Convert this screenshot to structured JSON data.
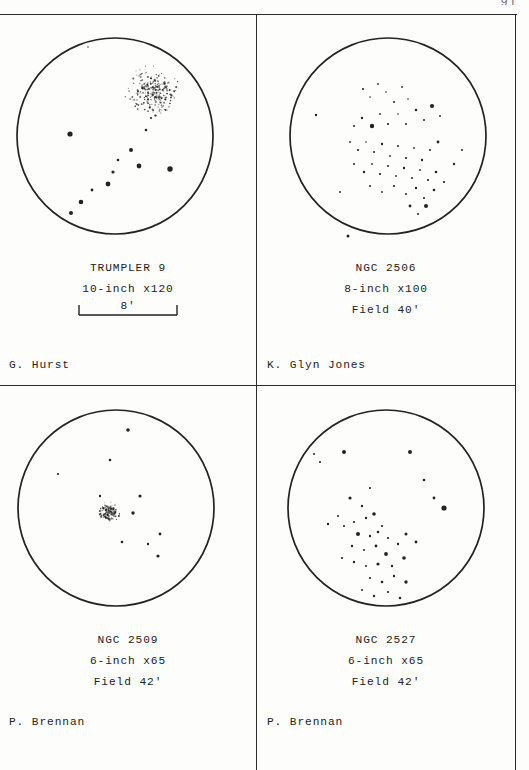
{
  "page": {
    "number": "91",
    "background_color": "#fdfdfb",
    "ink_color": "#232323"
  },
  "panels": [
    {
      "id": "trumpler-9",
      "object_name": "TRUMPLER 9",
      "instrument": "10-inch x120",
      "field_note": "",
      "scale_label": "8'",
      "observer": "G. Hurst",
      "circle": {
        "cx": 115,
        "cy": 122,
        "r": 98
      },
      "dense_cluster": {
        "cx": 152,
        "cy": 77,
        "r": 25,
        "point_count": 260,
        "type": "stipple"
      },
      "stars": [
        {
          "x": 88,
          "y": 33,
          "r": 0.7
        },
        {
          "x": 70,
          "y": 120,
          "r": 2.6
        },
        {
          "x": 146,
          "y": 116,
          "r": 1.3
        },
        {
          "x": 131,
          "y": 136,
          "r": 2.0
        },
        {
          "x": 118,
          "y": 146,
          "r": 1.3
        },
        {
          "x": 113,
          "y": 158,
          "r": 1.6
        },
        {
          "x": 139,
          "y": 152,
          "r": 2.4
        },
        {
          "x": 151,
          "y": 104,
          "r": 1.1
        },
        {
          "x": 170,
          "y": 155,
          "r": 2.7
        },
        {
          "x": 108,
          "y": 170,
          "r": 2.4
        },
        {
          "x": 92,
          "y": 176,
          "r": 1.4
        },
        {
          "x": 81,
          "y": 188,
          "r": 2.3
        },
        {
          "x": 71,
          "y": 199,
          "r": 2.0
        }
      ]
    },
    {
      "id": "ngc-2506",
      "object_name": "NGC 2506",
      "instrument": "8-inch x100",
      "field_note": "Field 40'",
      "scale_label": "",
      "observer": "K. Glyn Jones",
      "circle": {
        "cx": 130,
        "cy": 122,
        "r": 98
      },
      "dense_cluster": null,
      "stars": [
        {
          "x": 58,
          "y": 101,
          "r": 1.2
        },
        {
          "x": 82,
          "y": 178,
          "r": 1.0
        },
        {
          "x": 90,
          "y": 222,
          "r": 1.5
        },
        {
          "x": 105,
          "y": 75,
          "r": 1.1
        },
        {
          "x": 112,
          "y": 83,
          "r": 0.8
        },
        {
          "x": 120,
          "y": 70,
          "r": 0.9
        },
        {
          "x": 128,
          "y": 78,
          "r": 0.8
        },
        {
          "x": 136,
          "y": 88,
          "r": 1.0
        },
        {
          "x": 144,
          "y": 73,
          "r": 0.9
        },
        {
          "x": 150,
          "y": 85,
          "r": 0.8
        },
        {
          "x": 96,
          "y": 112,
          "r": 1.0
        },
        {
          "x": 104,
          "y": 104,
          "r": 1.2
        },
        {
          "x": 114,
          "y": 112,
          "r": 2.2
        },
        {
          "x": 122,
          "y": 100,
          "r": 0.9
        },
        {
          "x": 130,
          "y": 110,
          "r": 1.1
        },
        {
          "x": 140,
          "y": 100,
          "r": 0.8
        },
        {
          "x": 148,
          "y": 110,
          "r": 1.0
        },
        {
          "x": 158,
          "y": 96,
          "r": 1.3
        },
        {
          "x": 166,
          "y": 106,
          "r": 1.0
        },
        {
          "x": 174,
          "y": 92,
          "r": 2.1
        },
        {
          "x": 182,
          "y": 102,
          "r": 0.9
        },
        {
          "x": 92,
          "y": 128,
          "r": 0.9
        },
        {
          "x": 100,
          "y": 136,
          "r": 1.1
        },
        {
          "x": 108,
          "y": 128,
          "r": 0.8
        },
        {
          "x": 116,
          "y": 138,
          "r": 1.0
        },
        {
          "x": 124,
          "y": 130,
          "r": 1.2
        },
        {
          "x": 132,
          "y": 142,
          "r": 0.9
        },
        {
          "x": 140,
          "y": 132,
          "r": 1.0
        },
        {
          "x": 148,
          "y": 144,
          "r": 1.1
        },
        {
          "x": 156,
          "y": 134,
          "r": 0.9
        },
        {
          "x": 164,
          "y": 146,
          "r": 1.2
        },
        {
          "x": 172,
          "y": 136,
          "r": 1.0
        },
        {
          "x": 180,
          "y": 128,
          "r": 1.4
        },
        {
          "x": 96,
          "y": 150,
          "r": 1.0
        },
        {
          "x": 106,
          "y": 158,
          "r": 1.2
        },
        {
          "x": 114,
          "y": 150,
          "r": 0.9
        },
        {
          "x": 122,
          "y": 160,
          "r": 1.1
        },
        {
          "x": 130,
          "y": 152,
          "r": 1.0
        },
        {
          "x": 138,
          "y": 162,
          "r": 0.9
        },
        {
          "x": 146,
          "y": 154,
          "r": 1.2
        },
        {
          "x": 154,
          "y": 164,
          "r": 1.0
        },
        {
          "x": 162,
          "y": 156,
          "r": 0.9
        },
        {
          "x": 170,
          "y": 166,
          "r": 1.1
        },
        {
          "x": 178,
          "y": 158,
          "r": 1.3
        },
        {
          "x": 112,
          "y": 172,
          "r": 1.0
        },
        {
          "x": 124,
          "y": 178,
          "r": 0.9
        },
        {
          "x": 136,
          "y": 172,
          "r": 1.1
        },
        {
          "x": 148,
          "y": 180,
          "r": 1.0
        },
        {
          "x": 158,
          "y": 174,
          "r": 1.2
        },
        {
          "x": 166,
          "y": 184,
          "r": 1.0
        },
        {
          "x": 176,
          "y": 176,
          "r": 1.3
        },
        {
          "x": 186,
          "y": 168,
          "r": 1.1
        },
        {
          "x": 152,
          "y": 192,
          "r": 1.4
        },
        {
          "x": 160,
          "y": 200,
          "r": 1.0
        },
        {
          "x": 168,
          "y": 192,
          "r": 2.0
        },
        {
          "x": 196,
          "y": 150,
          "r": 1.2
        },
        {
          "x": 204,
          "y": 136,
          "r": 1.0
        }
      ]
    },
    {
      "id": "ngc-2509",
      "object_name": "NGC 2509",
      "instrument": "6-inch x65",
      "field_note": "Field 42'",
      "scale_label": "",
      "observer": "P. Brennan",
      "circle": {
        "cx": 116,
        "cy": 122,
        "r": 98
      },
      "dense_cluster": {
        "cx": 108,
        "cy": 126,
        "r": 11,
        "point_count": 150,
        "type": "stipple"
      },
      "stars": [
        {
          "x": 128,
          "y": 44,
          "r": 1.8
        },
        {
          "x": 110,
          "y": 74,
          "r": 1.3
        },
        {
          "x": 58,
          "y": 88,
          "r": 1.1
        },
        {
          "x": 140,
          "y": 110,
          "r": 1.6
        },
        {
          "x": 133,
          "y": 127,
          "r": 1.7
        },
        {
          "x": 100,
          "y": 110,
          "r": 1.2
        },
        {
          "x": 122,
          "y": 156,
          "r": 1.3
        },
        {
          "x": 148,
          "y": 158,
          "r": 1.2
        },
        {
          "x": 160,
          "y": 148,
          "r": 1.4
        },
        {
          "x": 158,
          "y": 170,
          "r": 1.6
        }
      ]
    },
    {
      "id": "ngc-2527",
      "object_name": "NGC 2527",
      "instrument": "6-inch x65",
      "field_note": "Field 42'",
      "scale_label": "",
      "observer": "P. Brennan",
      "circle": {
        "cx": 128,
        "cy": 122,
        "r": 98
      },
      "dense_cluster": null,
      "stars": [
        {
          "x": 56,
          "y": 68,
          "r": 1.0
        },
        {
          "x": 62,
          "y": 76,
          "r": 1.0
        },
        {
          "x": 86,
          "y": 66,
          "r": 2.0
        },
        {
          "x": 152,
          "y": 66,
          "r": 2.0
        },
        {
          "x": 166,
          "y": 94,
          "r": 1.3
        },
        {
          "x": 176,
          "y": 112,
          "r": 1.4
        },
        {
          "x": 186,
          "y": 122,
          "r": 2.6
        },
        {
          "x": 112,
          "y": 102,
          "r": 1.1
        },
        {
          "x": 104,
          "y": 120,
          "r": 1.2
        },
        {
          "x": 92,
          "y": 112,
          "r": 1.6
        },
        {
          "x": 80,
          "y": 130,
          "r": 1.0
        },
        {
          "x": 70,
          "y": 138,
          "r": 1.2
        },
        {
          "x": 86,
          "y": 140,
          "r": 1.0
        },
        {
          "x": 96,
          "y": 136,
          "r": 1.1
        },
        {
          "x": 108,
          "y": 132,
          "r": 1.2
        },
        {
          "x": 116,
          "y": 128,
          "r": 1.8
        },
        {
          "x": 124,
          "y": 140,
          "r": 1.1
        },
        {
          "x": 100,
          "y": 148,
          "r": 2.0
        },
        {
          "x": 112,
          "y": 150,
          "r": 1.2
        },
        {
          "x": 120,
          "y": 146,
          "r": 1.3
        },
        {
          "x": 130,
          "y": 152,
          "r": 1.1
        },
        {
          "x": 94,
          "y": 160,
          "r": 1.2
        },
        {
          "x": 106,
          "y": 164,
          "r": 1.0
        },
        {
          "x": 118,
          "y": 160,
          "r": 1.4
        },
        {
          "x": 128,
          "y": 168,
          "r": 1.9
        },
        {
          "x": 140,
          "y": 158,
          "r": 1.2
        },
        {
          "x": 148,
          "y": 148,
          "r": 1.5
        },
        {
          "x": 84,
          "y": 172,
          "r": 1.1
        },
        {
          "x": 96,
          "y": 176,
          "r": 1.2
        },
        {
          "x": 108,
          "y": 180,
          "r": 1.0
        },
        {
          "x": 120,
          "y": 178,
          "r": 1.6
        },
        {
          "x": 134,
          "y": 180,
          "r": 1.2
        },
        {
          "x": 146,
          "y": 172,
          "r": 1.8
        },
        {
          "x": 158,
          "y": 156,
          "r": 1.4
        },
        {
          "x": 112,
          "y": 192,
          "r": 1.1
        },
        {
          "x": 124,
          "y": 196,
          "r": 1.3
        },
        {
          "x": 136,
          "y": 190,
          "r": 1.2
        },
        {
          "x": 148,
          "y": 196,
          "r": 1.7
        },
        {
          "x": 104,
          "y": 204,
          "r": 1.0
        },
        {
          "x": 116,
          "y": 210,
          "r": 1.2
        },
        {
          "x": 130,
          "y": 206,
          "r": 1.1
        },
        {
          "x": 142,
          "y": 212,
          "r": 1.3
        }
      ]
    }
  ]
}
